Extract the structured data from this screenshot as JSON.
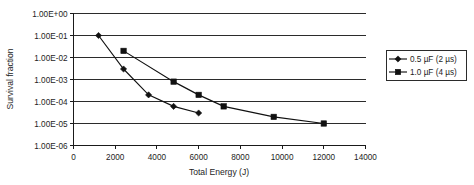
{
  "chart_data": {
    "type": "line",
    "title": "",
    "xlabel": "Total Energy (J)",
    "ylabel": "Survival fraction",
    "xlim": [
      0,
      14000
    ],
    "ylim": [
      1e-06,
      1.0
    ],
    "yscale": "log",
    "grid": true,
    "legend_position": "right-outside",
    "xticks": [
      0,
      2000,
      4000,
      6000,
      8000,
      10000,
      12000,
      14000
    ],
    "xtick_labels": [
      "0",
      "2000",
      "4000",
      "6000",
      "8000",
      "10000",
      "12000",
      "14000"
    ],
    "yticks": [
      1.0,
      0.1,
      0.01,
      0.001,
      0.0001,
      1e-05,
      1e-06
    ],
    "ytick_labels": [
      "1.00E+00",
      "1.00E-01",
      "1.00E-02",
      "1.00E-03",
      "1.00E-04",
      "1.00E-05",
      "1.00E-06"
    ],
    "series": [
      {
        "name": "0.5 µF (2 µs)",
        "marker": "diamond",
        "color": "#111111",
        "x": [
          1200,
          2400,
          3600,
          4800,
          6000
        ],
        "y": [
          0.1,
          0.003,
          0.0002,
          6e-05,
          3e-05
        ]
      },
      {
        "name": "1.0 µF (4 µs)",
        "marker": "square",
        "color": "#111111",
        "x": [
          2400,
          4800,
          6000,
          7200,
          9600,
          12000
        ],
        "y": [
          0.02,
          0.0008,
          0.0002,
          6e-05,
          2e-05,
          1e-05
        ]
      }
    ]
  },
  "legend": {
    "entries": [
      {
        "label": "0.5 µF (2 µs)",
        "marker": "diamond"
      },
      {
        "label": "1.0 µF (4 µs)",
        "marker": "square"
      }
    ]
  }
}
